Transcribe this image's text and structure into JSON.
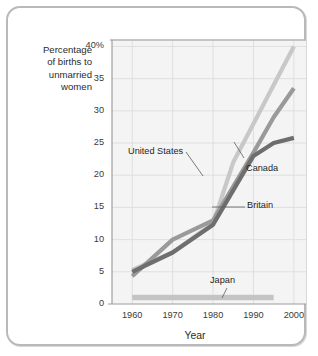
{
  "figure": {
    "y_axis_label_lines": [
      "Percentage",
      "of births to",
      "unmarried",
      "women"
    ],
    "x_axis_title": "Year"
  },
  "chart_data": {
    "type": "line",
    "title": "",
    "subtitle": "",
    "xlabel": "Year",
    "ylabel": "Percentage of births to unmarried women",
    "xlim": [
      1955,
      2003
    ],
    "ylim": [
      0,
      41
    ],
    "xticks": [
      1960,
      1970,
      1980,
      1990,
      2000
    ],
    "xtick_labels": [
      "1960",
      "1970",
      "1980",
      "1990",
      "2000"
    ],
    "yticks": [
      0,
      5,
      10,
      15,
      20,
      25,
      30,
      35,
      40
    ],
    "ytick_labels": [
      "0",
      "5",
      "10",
      "15",
      "20",
      "25",
      "30",
      "35",
      "40%"
    ],
    "grid": true,
    "legend": "inline annotations",
    "series": [
      {
        "name": "United States",
        "color": "#c8c8c8",
        "x": [
          1960,
          1970,
          1980,
          1985,
          1990,
          1995,
          2000
        ],
        "values": [
          5.3,
          8.0,
          12.5,
          22.0,
          28.0,
          34.0,
          40.0
        ]
      },
      {
        "name": "Canada",
        "color": "#9a9a9a",
        "x": [
          1960,
          1970,
          1980,
          1990,
          1995,
          2000
        ],
        "values": [
          4.3,
          10.0,
          13.0,
          23.5,
          29.0,
          33.5
        ]
      },
      {
        "name": "Britain",
        "color": "#6e6e6e",
        "x": [
          1960,
          1970,
          1980,
          1990,
          1995,
          2000
        ],
        "values": [
          5.0,
          8.0,
          12.3,
          23.0,
          25.0,
          25.8
        ]
      },
      {
        "name": "Japan",
        "color": "#c4c4c4",
        "x": [
          1960,
          1970,
          1980,
          1990,
          1995
        ],
        "values": [
          1.0,
          1.0,
          1.0,
          1.0,
          1.0
        ]
      }
    ],
    "annotations": [
      {
        "text": "United States",
        "series": "United States"
      },
      {
        "text": "Canada",
        "series": "Canada"
      },
      {
        "text": "Britain",
        "series": "Britain"
      },
      {
        "text": "Japan",
        "series": "Japan"
      }
    ]
  }
}
